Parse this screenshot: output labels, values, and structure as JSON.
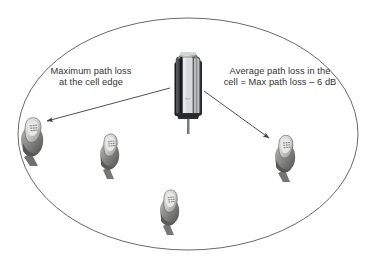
{
  "figure": {
    "type": "cellular-coverage-diagram",
    "background_color": "#ffffff",
    "line_color": "#55585c",
    "text_color": "#333333",
    "cell": {
      "name": "cell-boundary-ellipse",
      "shape": "ellipse",
      "cx": 188,
      "cy": 134,
      "rx": 170,
      "ry": 116
    },
    "base_station": {
      "name": "base-station-antenna",
      "x": 170,
      "y": 50,
      "width": 36,
      "height": 78
    }
  },
  "annotations": {
    "max_path_loss": {
      "line1": "Maximum path loss",
      "line2": "at the cell edge"
    },
    "avg_path_loss": {
      "line1": "Average path loss in the",
      "line2": "cell = Max path loss – 6 dB"
    }
  },
  "arrows": [
    {
      "name": "arrow-max-path-loss",
      "from": [
        170,
        88
      ],
      "to": [
        44,
        122
      ],
      "points_to": "handset-cell-edge-left"
    },
    {
      "name": "arrow-avg-path-loss",
      "from": [
        204,
        91
      ],
      "to": [
        272,
        140
      ],
      "points_to": "handset-right"
    }
  ],
  "handsets": [
    {
      "name": "handset-cell-edge-left",
      "x": 18,
      "y": 113,
      "width": 34,
      "height": 52
    },
    {
      "name": "handset-inner-left",
      "x": 96,
      "y": 130,
      "width": 30,
      "height": 48
    },
    {
      "name": "handset-right",
      "x": 271,
      "y": 131,
      "width": 32,
      "height": 50
    },
    {
      "name": "handset-bottom",
      "x": 156,
      "y": 186,
      "width": 30,
      "height": 48
    }
  ]
}
